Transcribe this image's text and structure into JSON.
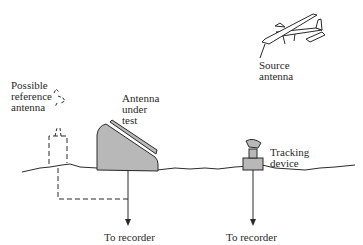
{
  "diagram": {
    "type": "antenna-range-measurement-setup",
    "labels": {
      "reference_antenna": [
        "Possible",
        "reference",
        "antenna"
      ],
      "antenna_under_test": [
        "Antenna",
        "under",
        "test"
      ],
      "source_antenna": [
        "Source",
        "antenna"
      ],
      "tracking_device": [
        "Tracking",
        "device"
      ],
      "recorder_left": "To recorder",
      "recorder_right": "To recorder"
    },
    "colors": {
      "line": "#2a2a2a",
      "antenna_fill": "#b8b8b8",
      "background": "#ffffff"
    }
  }
}
